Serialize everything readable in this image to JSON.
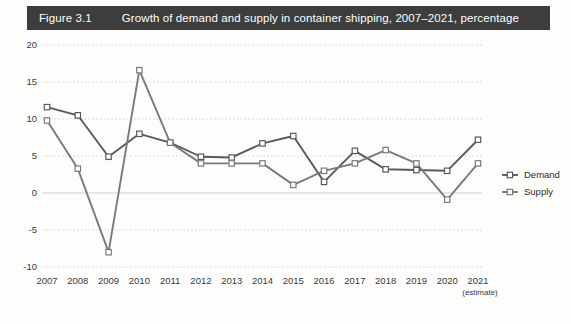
{
  "figure": {
    "number": "Figure 3.1",
    "title": "Growth of demand and supply in container shipping, 2007–2021, percentage",
    "band_color": "#3d3d3d",
    "band_text_color": "#ffffff"
  },
  "chart_data": {
    "type": "line",
    "title": "Growth of demand and supply in container shipping, 2007–2021, percentage",
    "xlabel": "",
    "ylabel": "",
    "categories": [
      "2007",
      "2008",
      "2009",
      "2010",
      "2011",
      "2012",
      "2013",
      "2014",
      "2015",
      "2016",
      "2017",
      "2018",
      "2019",
      "2020",
      "2021"
    ],
    "x_tick_sublabels": [
      "",
      "",
      "",
      "",
      "",
      "",
      "",
      "",
      "",
      "",
      "",
      "",
      "",
      "",
      "(estimate)"
    ],
    "series": [
      {
        "name": "Demand",
        "color": "#5a5a5a",
        "marker": "open-square",
        "values": [
          11.6,
          10.5,
          4.9,
          8.0,
          6.8,
          4.9,
          4.8,
          6.7,
          7.7,
          1.5,
          5.7,
          3.2,
          3.1,
          3.0,
          7.2
        ]
      },
      {
        "name": "Supply",
        "color": "#7a7a7a",
        "marker": "open-square",
        "values": [
          9.8,
          3.3,
          -8.0,
          16.6,
          6.8,
          4.0,
          4.0,
          4.0,
          1.1,
          3.0,
          4.0,
          5.8,
          4.0,
          -0.9,
          4.0
        ]
      }
    ],
    "ylim": [
      -10,
      20
    ],
    "yticks": [
      -10,
      -5,
      0,
      5,
      10,
      15,
      20
    ],
    "ytick_labels": [
      "-10",
      "-5",
      "0",
      "5",
      "10",
      "15",
      "20"
    ],
    "grid": true,
    "grid_color": "#c9c9c9",
    "legend_position": "right"
  },
  "legend": {
    "items": [
      {
        "label": "Demand",
        "color": "#5a5a5a"
      },
      {
        "label": "Supply",
        "color": "#7a7a7a"
      }
    ]
  }
}
